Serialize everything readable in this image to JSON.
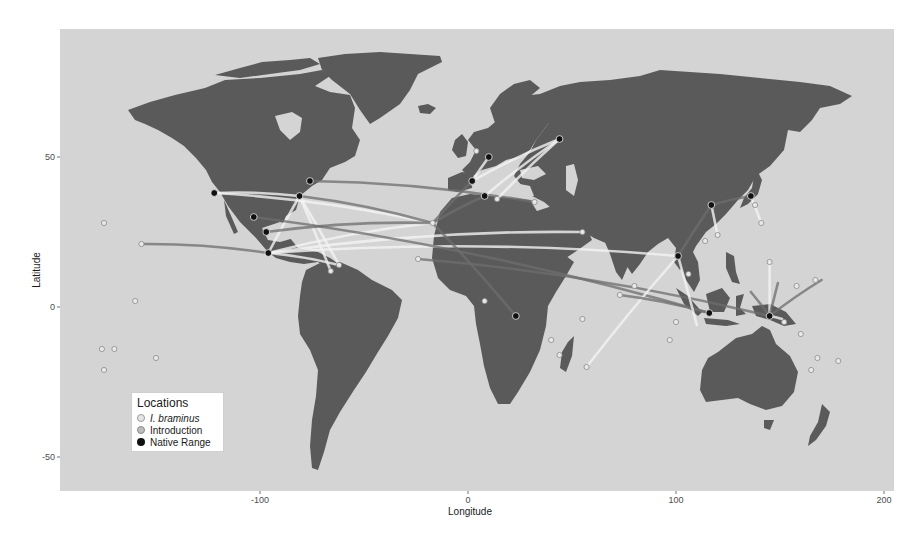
{
  "chart_data": {
    "type": "map-network",
    "title": "",
    "xlabel": "Longitude",
    "ylabel": "Latitude",
    "xlim": [
      -190,
      205
    ],
    "ylim": [
      -62,
      93
    ],
    "x_ticks": [
      -100,
      0,
      100,
      200
    ],
    "y_ticks": [
      -50,
      0,
      50
    ],
    "grid": false,
    "colors": {
      "background": "#d4d4d4",
      "land": "#5a5a5a",
      "native": "#111111",
      "introduction": "#e8e8e8",
      "braminus": "#d8d8d8",
      "line_light": "#f2f2f2",
      "line_dark": "#6e6e6e"
    },
    "legend": {
      "title": "Locations",
      "position": "bottom-left",
      "entries": [
        {
          "label": "I. braminus",
          "italic": true,
          "color": "#d8d8d8"
        },
        {
          "label": "Introduction",
          "italic": false,
          "color": "#bdbdbd"
        },
        {
          "label": "Native Range",
          "italic": false,
          "color": "#111111"
        }
      ]
    },
    "native_points": [
      {
        "lon": -122,
        "lat": 38
      },
      {
        "lon": -81,
        "lat": 37
      },
      {
        "lon": -76,
        "lat": 42
      },
      {
        "lon": -103,
        "lat": 30
      },
      {
        "lon": -97,
        "lat": 25
      },
      {
        "lon": -96,
        "lat": 18
      },
      {
        "lon": 2,
        "lat": 42
      },
      {
        "lon": 8,
        "lat": 37
      },
      {
        "lon": 10,
        "lat": 50
      },
      {
        "lon": 44,
        "lat": 56
      },
      {
        "lon": 23,
        "lat": -3
      },
      {
        "lon": 117,
        "lat": 34
      },
      {
        "lon": 136,
        "lat": 37
      },
      {
        "lon": 101,
        "lat": 17
      },
      {
        "lon": 116,
        "lat": -2
      },
      {
        "lon": 145,
        "lat": -3
      }
    ],
    "introduction_points": [
      {
        "lon": -175,
        "lat": 28
      },
      {
        "lon": -157,
        "lat": 21
      },
      {
        "lon": -176,
        "lat": -14
      },
      {
        "lon": -170,
        "lat": -14
      },
      {
        "lon": -160,
        "lat": 2
      },
      {
        "lon": -150,
        "lat": -17
      },
      {
        "lon": -175,
        "lat": -21
      },
      {
        "lon": -62,
        "lat": 14
      },
      {
        "lon": -66,
        "lat": 12
      },
      {
        "lon": -17,
        "lat": 28
      },
      {
        "lon": -24,
        "lat": 16
      },
      {
        "lon": 8,
        "lat": 2
      },
      {
        "lon": 40,
        "lat": -11
      },
      {
        "lon": 44,
        "lat": -16
      },
      {
        "lon": 55,
        "lat": -4
      },
      {
        "lon": 57,
        "lat": -20
      },
      {
        "lon": 73,
        "lat": 4
      },
      {
        "lon": 100,
        "lat": -5
      },
      {
        "lon": 97,
        "lat": -11
      },
      {
        "lon": 120,
        "lat": 24
      },
      {
        "lon": 138,
        "lat": 34
      },
      {
        "lon": 141,
        "lat": 28
      },
      {
        "lon": 145,
        "lat": 15
      },
      {
        "lon": 158,
        "lat": 7
      },
      {
        "lon": 167,
        "lat": 9
      },
      {
        "lon": 160,
        "lat": -9
      },
      {
        "lon": 168,
        "lat": -17
      },
      {
        "lon": 178,
        "lat": -18
      },
      {
        "lon": 165,
        "lat": -21
      },
      {
        "lon": 152,
        "lat": -5
      },
      {
        "lon": 4,
        "lat": 52
      },
      {
        "lon": 14,
        "lat": 36
      },
      {
        "lon": 32,
        "lat": 35
      },
      {
        "lon": 55,
        "lat": 25
      },
      {
        "lon": 80,
        "lat": 7
      },
      {
        "lon": 106,
        "lat": 11
      },
      {
        "lon": 114,
        "lat": 22
      }
    ],
    "routes": [
      {
        "from": [
          -122,
          38
        ],
        "to": [
          -17,
          28
        ],
        "shade": "light"
      },
      {
        "from": [
          -122,
          38
        ],
        "to": [
          -81,
          37
        ],
        "shade": "light"
      },
      {
        "from": [
          -81,
          37
        ],
        "to": [
          -17,
          28
        ],
        "shade": "dark"
      },
      {
        "from": [
          -81,
          37
        ],
        "to": [
          -66,
          12
        ],
        "shade": "light"
      },
      {
        "from": [
          -81,
          37
        ],
        "to": [
          -96,
          18
        ],
        "shade": "light"
      },
      {
        "from": [
          -81,
          37
        ],
        "to": [
          -62,
          14
        ],
        "shade": "light"
      },
      {
        "from": [
          -96,
          18
        ],
        "to": [
          -62,
          14
        ],
        "shade": "light"
      },
      {
        "from": [
          -96,
          18
        ],
        "to": [
          -17,
          28
        ],
        "shade": "light"
      },
      {
        "from": [
          -96,
          18
        ],
        "to": [
          101,
          17
        ],
        "shade": "light"
      },
      {
        "from": [
          -96,
          18
        ],
        "to": [
          55,
          25
        ],
        "shade": "light"
      },
      {
        "from": [
          -157,
          21
        ],
        "to": [
          -96,
          18
        ],
        "shade": "dark"
      },
      {
        "from": [
          -97,
          25
        ],
        "to": [
          -17,
          28
        ],
        "shade": "dark"
      },
      {
        "from": [
          -103,
          30
        ],
        "to": [
          116,
          -2
        ],
        "shade": "dark"
      },
      {
        "from": [
          -76,
          42
        ],
        "to": [
          32,
          35
        ],
        "shade": "dark"
      },
      {
        "from": [
          -17,
          28
        ],
        "to": [
          2,
          42
        ],
        "shade": "dark"
      },
      {
        "from": [
          -17,
          28
        ],
        "to": [
          8,
          37
        ],
        "shade": "dark"
      },
      {
        "from": [
          -17,
          28
        ],
        "to": [
          23,
          -3
        ],
        "shade": "dark"
      },
      {
        "from": [
          2,
          42
        ],
        "to": [
          44,
          56
        ],
        "shade": "light"
      },
      {
        "from": [
          8,
          37
        ],
        "to": [
          44,
          56
        ],
        "shade": "light"
      },
      {
        "from": [
          14,
          36
        ],
        "to": [
          44,
          56
        ],
        "shade": "light"
      },
      {
        "from": [
          10,
          50
        ],
        "to": [
          2,
          42
        ],
        "shade": "light"
      },
      {
        "from": [
          -24,
          16
        ],
        "to": [
          145,
          -3
        ],
        "shade": "dark"
      },
      {
        "from": [
          57,
          -20
        ],
        "to": [
          101,
          17
        ],
        "shade": "light"
      },
      {
        "from": [
          73,
          4
        ],
        "to": [
          116,
          -2
        ],
        "shade": "dark"
      },
      {
        "from": [
          101,
          17
        ],
        "to": [
          117,
          34
        ],
        "shade": "dark"
      },
      {
        "from": [
          101,
          17
        ],
        "to": [
          110,
          -6
        ],
        "shade": "light"
      },
      {
        "from": [
          117,
          34
        ],
        "to": [
          136,
          37
        ],
        "shade": "dark"
      },
      {
        "from": [
          117,
          34
        ],
        "to": [
          120,
          24
        ],
        "shade": "light"
      },
      {
        "from": [
          136,
          37
        ],
        "to": [
          141,
          28
        ],
        "shade": "light"
      },
      {
        "from": [
          145,
          -3
        ],
        "to": [
          145,
          15
        ],
        "shade": "light"
      },
      {
        "from": [
          145,
          -3
        ],
        "to": [
          136,
          5
        ],
        "shade": "dark"
      },
      {
        "from": [
          145,
          -3
        ],
        "to": [
          149,
          8
        ],
        "shade": "dark"
      },
      {
        "from": [
          145,
          -3
        ],
        "to": [
          170,
          9
        ],
        "shade": "dark"
      },
      {
        "from": [
          145,
          -3
        ],
        "to": [
          151,
          -4
        ],
        "shade": "light"
      }
    ]
  }
}
